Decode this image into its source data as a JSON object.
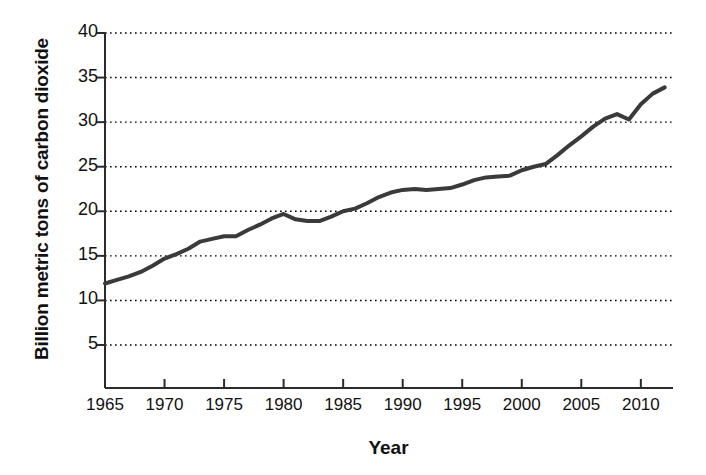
{
  "chart_data": {
    "type": "line",
    "title": "",
    "xlabel": "Year",
    "ylabel": "Billion metric tons of carbon dioxide",
    "xlim": [
      1965,
      2012.7
    ],
    "ylim": [
      0,
      40
    ],
    "xticks": [
      1965,
      1970,
      1975,
      1980,
      1985,
      1990,
      1995,
      2000,
      2005,
      2010
    ],
    "yticks": [
      5,
      10,
      15,
      20,
      25,
      30,
      35,
      40
    ],
    "xtick_labels": [
      "1965",
      "1970",
      "1975",
      "1980",
      "1985",
      "1990",
      "1995",
      "2000",
      "2005",
      "2010"
    ],
    "ytick_labels": [
      "5",
      "10",
      "15",
      "20",
      "25",
      "30",
      "35",
      "40"
    ],
    "grid": "horizontal-dotted",
    "legend": "none",
    "line_color": "#3a3a3a",
    "line_width_px": 4,
    "x": [
      1965,
      1966,
      1967,
      1968,
      1969,
      1970,
      1971,
      1972,
      1973,
      1974,
      1975,
      1976,
      1977,
      1978,
      1979,
      1980,
      1981,
      1982,
      1983,
      1984,
      1985,
      1986,
      1987,
      1988,
      1989,
      1990,
      1991,
      1992,
      1993,
      1994,
      1995,
      1996,
      1997,
      1998,
      1999,
      2000,
      2001,
      2002,
      2003,
      2004,
      2005,
      2006,
      2007,
      2008,
      2009,
      2010,
      2011,
      2012
    ],
    "values": [
      11.9,
      12.3,
      12.7,
      13.2,
      13.9,
      14.7,
      15.2,
      15.8,
      16.6,
      16.9,
      17.2,
      17.2,
      17.9,
      18.5,
      19.2,
      19.7,
      19.1,
      18.9,
      18.9,
      19.4,
      20.0,
      20.3,
      20.9,
      21.6,
      22.1,
      22.4,
      22.5,
      22.4,
      22.5,
      22.6,
      23.0,
      23.5,
      23.8,
      23.9,
      24.0,
      24.6,
      25.0,
      25.3,
      26.3,
      27.4,
      28.4,
      29.5,
      30.4,
      30.9,
      30.3,
      32.0,
      33.2,
      33.9
    ],
    "units": "Billion metric tons of carbon dioxide"
  }
}
